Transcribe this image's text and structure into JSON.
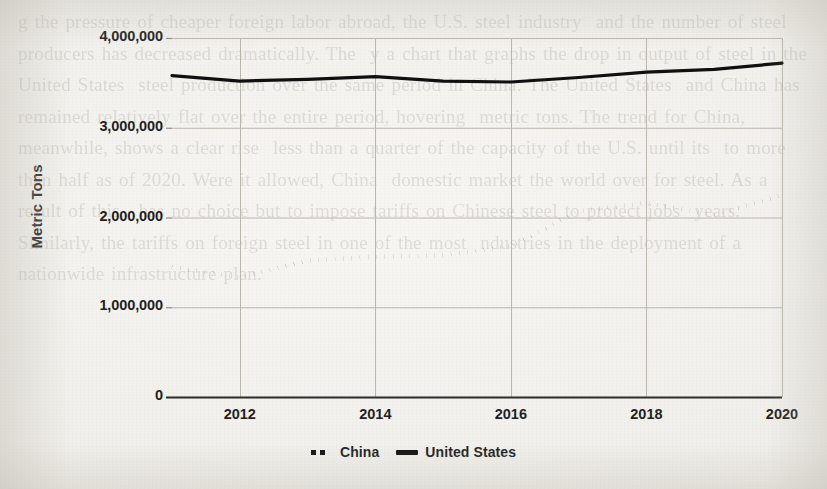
{
  "page": {
    "background_color": "#f1f0ec",
    "ghost_text": "g the pressure of cheaper foreign labor abroad, the U.S. steel industry  and the number of steel producers has decreased dramatically. The  y a chart that graphs the drop in output of steel in the United States  steel production over the same period in China. The United States  and China has remained relatively flat over the entire period, hovering  metric tons. The trend for China, meanwhile, shows a clear rise  less than a quarter of the capacity of the U.S. until its  to more than half as of 2020. Were it allowed, China  domestic market the world over for steel. As a result of this,  has no choice but to impose tariffs on Chinese steel to protect jobs  years. Similarly, the tariffs on foreign steel in one of the most  ndustries in the deployment of a nationwide infrastructure plan."
  },
  "chart_data": {
    "type": "line",
    "title": "",
    "xlabel": "",
    "ylabel": "Metric Tons",
    "xlim": [
      2011,
      2020
    ],
    "ylim": [
      0,
      4000000
    ],
    "grid": true,
    "legend_position": "bottom",
    "x": [
      2011,
      2012,
      2013,
      2014,
      2015,
      2016,
      2017,
      2018,
      2019,
      2020
    ],
    "y_ticks": [
      0,
      1000000,
      2000000,
      3000000,
      4000000
    ],
    "y_tick_labels": [
      "0",
      "1,000,000",
      "2,000,000",
      "3,000,000",
      "4,000,000"
    ],
    "x_ticks": [
      2012,
      2014,
      2016,
      2018,
      2020
    ],
    "x_tick_labels": [
      "2012",
      "2014",
      "2016",
      "2018",
      "2020"
    ],
    "series": [
      {
        "name": "China",
        "style": "dotted",
        "color": "#101010",
        "values": [
          1450000,
          1330000,
          1520000,
          1560000,
          1580000,
          1680000,
          2070000,
          2160000,
          2030000,
          2250000
        ]
      },
      {
        "name": "United States",
        "style": "solid",
        "color": "#101010",
        "values": [
          3580000,
          3520000,
          3540000,
          3570000,
          3520000,
          3510000,
          3560000,
          3620000,
          3650000,
          3720000
        ]
      }
    ]
  },
  "legend": {
    "items": [
      {
        "label": "China",
        "marker": "dotted-swatch"
      },
      {
        "label": "United States",
        "marker": "solid-swatch"
      }
    ]
  }
}
